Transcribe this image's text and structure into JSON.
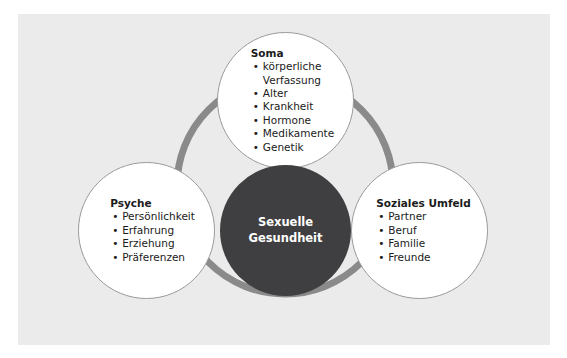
{
  "figure": {
    "type": "venn-like-concept-diagram",
    "panel_background": "#ebebeb",
    "ring_color": "#8a8a8a",
    "core_color": "#3f3f41",
    "node_fill": "#ffffff",
    "node_border": "#9a9a9a",
    "text_color": "#1b1b1b",
    "core_text_color": "#ffffff"
  },
  "core": {
    "name": "Sexuelle Gesundheit",
    "line1": "Sexuelle",
    "line2": "Gesundheit"
  },
  "nodes": [
    {
      "id": "soma",
      "title": "Soma",
      "items": [
        "körperliche\nVerfassung",
        "Alter",
        "Krankheit",
        "Hormone",
        "Medikamente",
        "Genetik"
      ]
    },
    {
      "id": "psyche",
      "title": "Psyche",
      "items": [
        "Persönlichkeit",
        "Erfahrung",
        "Erziehung",
        "Präferenzen"
      ]
    },
    {
      "id": "social",
      "title": "Soziales Umfeld",
      "items": [
        "Partner",
        "Beruf",
        "Familie",
        "Freunde"
      ]
    }
  ]
}
